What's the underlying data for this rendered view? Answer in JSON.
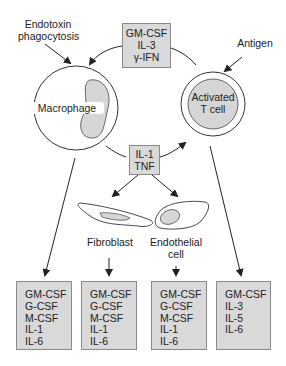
{
  "inputs": {
    "endotoxin_label_line1": "Endotoxin",
    "endotoxin_label_line2": "phagocytosis",
    "antigen_label": "Antigen"
  },
  "top_box": {
    "lines": [
      "GM-CSF",
      "IL-3",
      "γ-IFN"
    ]
  },
  "cells": {
    "macrophage": "Macrophage",
    "t_cell_line1": "Activated",
    "t_cell_line2": "T cell",
    "fibroblast": "Fibroblast",
    "endothelial_line1": "Endothelial",
    "endothelial_line2": "cell"
  },
  "middle_box": {
    "lines": [
      "IL-1",
      "TNF"
    ]
  },
  "output_boxes": [
    {
      "source": "Macrophage",
      "lines": [
        "GM-CSF",
        "G-CSF",
        "M-CSF",
        "IL-1",
        "IL-6"
      ]
    },
    {
      "source": "Fibroblast",
      "lines": [
        "GM-CSF",
        "G-CSF",
        "M-CSF",
        "IL-1",
        "IL-6"
      ]
    },
    {
      "source": "Endothelial cell",
      "lines": [
        "GM-CSF",
        "G-CSF",
        "M-CSF",
        "IL-1",
        "IL-6"
      ]
    },
    {
      "source": "Activated T cell",
      "lines": [
        "GM-CSF",
        "IL-3",
        "IL-5",
        "IL-6"
      ]
    }
  ],
  "colors": {
    "box_fill": "#d9d9d9",
    "box_border": "#8a8a8a",
    "nucleus_fill": "#d6d6d6",
    "line": "#222222"
  }
}
